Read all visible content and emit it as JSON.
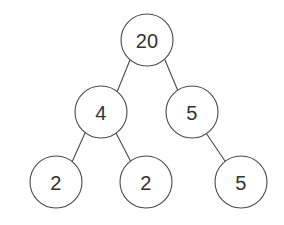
{
  "diagram": {
    "type": "binary-tree",
    "background_color": "#ffffff",
    "node_fill_color": "#ffffff",
    "node_stroke_color": "#4a4a4a",
    "edge_color": "#4a4a4a",
    "label_color": "#333333",
    "node_radius": 26,
    "nodes": [
      {
        "id": "root",
        "label": "20",
        "cx": 147,
        "cy": 40,
        "r": 26,
        "font_size": 20,
        "level": 0
      },
      {
        "id": "n-left",
        "label": "4",
        "cx": 101,
        "cy": 112,
        "r": 26,
        "font_size": 20,
        "level": 1
      },
      {
        "id": "n-right",
        "label": "5",
        "cx": 192,
        "cy": 112,
        "r": 26,
        "font_size": 20,
        "level": 1
      },
      {
        "id": "leaf-1",
        "label": "2",
        "cx": 56,
        "cy": 182,
        "r": 26,
        "font_size": 20,
        "level": 2
      },
      {
        "id": "leaf-2",
        "label": "2",
        "cx": 146,
        "cy": 182,
        "r": 26,
        "font_size": 20,
        "level": 2
      },
      {
        "id": "leaf-3",
        "label": "5",
        "cx": 241,
        "cy": 182,
        "r": 26,
        "font_size": 20,
        "level": 2
      }
    ],
    "edges": [
      {
        "id": "edge-root-left",
        "from": "root",
        "to": "n-left",
        "x1": 130,
        "y1": 60,
        "x2": 117,
        "y2": 92
      },
      {
        "id": "edge-root-right",
        "from": "root",
        "to": "n-right",
        "x1": 165,
        "y1": 60,
        "x2": 178,
        "y2": 91
      },
      {
        "id": "edge-left-leaf1",
        "from": "n-left",
        "to": "leaf-1",
        "x1": 85,
        "y1": 133,
        "x2": 72,
        "y2": 162
      },
      {
        "id": "edge-left-leaf2",
        "from": "n-left",
        "to": "leaf-2",
        "x1": 116,
        "y1": 133,
        "x2": 131,
        "y2": 162
      },
      {
        "id": "edge-right-leaf3",
        "from": "n-right",
        "to": "leaf-3",
        "x1": 206,
        "y1": 133,
        "x2": 225,
        "y2": 161
      }
    ]
  }
}
